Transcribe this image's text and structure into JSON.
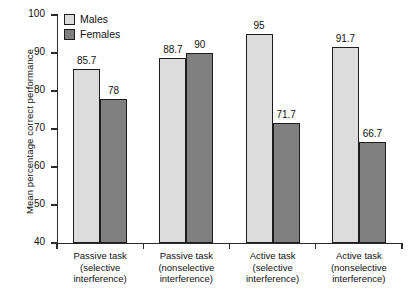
{
  "chart_data": {
    "type": "bar",
    "title": "",
    "xlabel": "",
    "ylabel": "Mean percentage correct performance",
    "ylim": [
      40,
      100
    ],
    "yticks": [
      40,
      50,
      60,
      70,
      80,
      90,
      100
    ],
    "grid": false,
    "legend_position": "top-left",
    "categories": [
      "Passive task (selective interference)",
      "Passive task (nonselective interference)",
      "Active task (selective interference)",
      "Active task (nonselective interference)"
    ],
    "category_lines": [
      [
        "Passive task",
        "(selective",
        "interference)"
      ],
      [
        "Passive task",
        "(nonselective",
        "interference)"
      ],
      [
        "Active task",
        "(selective",
        "interference)"
      ],
      [
        "Active task",
        "(nonselective",
        "interference)"
      ]
    ],
    "series": [
      {
        "name": "Males",
        "color": "#dcdcdc",
        "values": [
          85.7,
          88.7,
          95,
          91.7
        ],
        "labels": [
          "85.7",
          "88.7",
          "95",
          "91.7"
        ]
      },
      {
        "name": "Females",
        "color": "#808080",
        "values": [
          78,
          90,
          71.7,
          66.7
        ],
        "labels": [
          "78",
          "90",
          "71.7",
          "66.7"
        ]
      }
    ]
  },
  "legend": {
    "items": [
      {
        "label": "Males",
        "color": "#dcdcdc"
      },
      {
        "label": "Females",
        "color": "#808080"
      }
    ]
  },
  "axis": {
    "y_title": "Mean percentage correct performance",
    "y_labels": [
      "100",
      "90",
      "80",
      "70",
      "60",
      "50",
      "40"
    ]
  }
}
